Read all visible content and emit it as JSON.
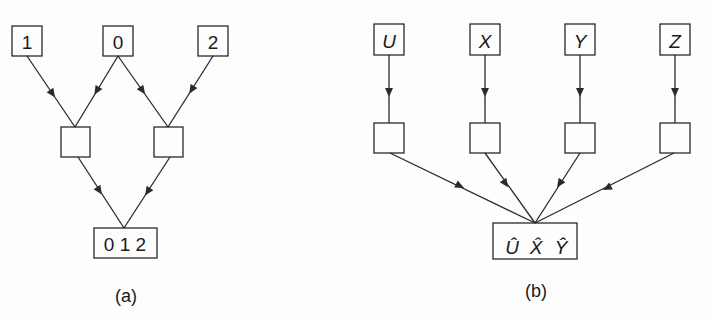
{
  "diagram_a": {
    "caption": "(a)",
    "inputs": [
      "1",
      "0",
      "2"
    ],
    "output": "0 1 2"
  },
  "diagram_b": {
    "caption": "(b)",
    "inputs": [
      "U",
      "X",
      "Y",
      "Z"
    ],
    "output": [
      "Û",
      "X̂",
      "Ŷ"
    ],
    "output_text": "Û X̂ Ŷ"
  },
  "colors": {
    "stroke": "#2a2a2a",
    "background": "#fdfdfd"
  }
}
